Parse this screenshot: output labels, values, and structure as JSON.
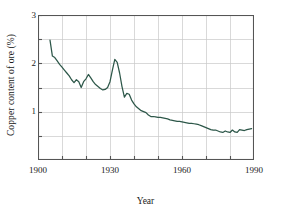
{
  "chart_data": {
    "type": "line",
    "title": "",
    "xlabel": "Year",
    "ylabel": "Copper content of ore (%)",
    "xlim": [
      1900,
      1990
    ],
    "ylim": [
      0,
      3
    ],
    "xticks": [
      1900,
      1930,
      1960,
      1990
    ],
    "xtick_labels": [
      "1900",
      "1930",
      "1960",
      "1990"
    ],
    "x_minor_ticks": [
      1910,
      1920,
      1940,
      1950,
      1970,
      1980
    ],
    "yticks": [
      1,
      2,
      3
    ],
    "ytick_labels": [
      "1",
      "2",
      "3"
    ],
    "y_minor_ticks": [
      0.5,
      1.5,
      2.5
    ],
    "grid": true,
    "grid_x_step": 10,
    "grid_y_step": 0.5,
    "legend": null,
    "line_color": "#2d5749",
    "series": [
      {
        "name": "Copper content of ore",
        "x": [
          1905,
          1906,
          1907,
          1908,
          1909,
          1910,
          1911,
          1912,
          1913,
          1914,
          1915,
          1916,
          1917,
          1918,
          1919,
          1920,
          1921,
          1922,
          1923,
          1924,
          1925,
          1926,
          1927,
          1928,
          1929,
          1930,
          1931,
          1932,
          1933,
          1934,
          1935,
          1936,
          1937,
          1938,
          1939,
          1940,
          1941,
          1942,
          1943,
          1944,
          1945,
          1946,
          1947,
          1948,
          1949,
          1950,
          1951,
          1952,
          1953,
          1954,
          1955,
          1956,
          1957,
          1958,
          1959,
          1960,
          1961,
          1962,
          1963,
          1964,
          1965,
          1966,
          1967,
          1968,
          1969,
          1970,
          1971,
          1972,
          1973,
          1974,
          1975,
          1976,
          1977,
          1978,
          1979,
          1980,
          1981,
          1982,
          1983,
          1984,
          1985,
          1986,
          1987,
          1988,
          1989
        ],
        "y": [
          2.48,
          2.15,
          2.12,
          2.05,
          1.98,
          1.92,
          1.86,
          1.8,
          1.74,
          1.66,
          1.6,
          1.66,
          1.62,
          1.5,
          1.62,
          1.68,
          1.77,
          1.7,
          1.62,
          1.56,
          1.52,
          1.48,
          1.45,
          1.46,
          1.5,
          1.62,
          1.86,
          2.08,
          2.02,
          1.8,
          1.52,
          1.3,
          1.38,
          1.36,
          1.24,
          1.16,
          1.1,
          1.06,
          1.02,
          1.0,
          0.98,
          0.93,
          0.9,
          0.9,
          0.89,
          0.88,
          0.88,
          0.87,
          0.86,
          0.85,
          0.83,
          0.82,
          0.81,
          0.8,
          0.8,
          0.79,
          0.78,
          0.77,
          0.76,
          0.76,
          0.75,
          0.74,
          0.73,
          0.71,
          0.69,
          0.67,
          0.65,
          0.63,
          0.62,
          0.62,
          0.6,
          0.58,
          0.57,
          0.6,
          0.58,
          0.57,
          0.62,
          0.58,
          0.57,
          0.63,
          0.62,
          0.61,
          0.63,
          0.64,
          0.65
        ]
      }
    ]
  },
  "axes": {
    "ylabel_text": "Copper content of ore (%)",
    "xlabel_text": "Year"
  }
}
